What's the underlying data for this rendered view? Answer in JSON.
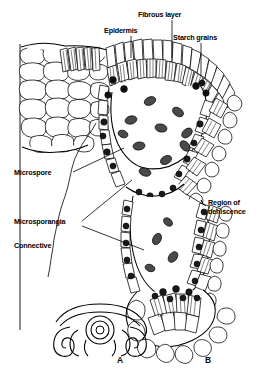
{
  "figure": {
    "background_color": "#ffffff",
    "ink_color": "#000000",
    "style": "black-and-white line drawing"
  },
  "labels": [
    {
      "id": "fibrous-layer",
      "text": "Fibrous layer",
      "x": 138,
      "y": 17,
      "anchor": "start"
    },
    {
      "id": "epidermis",
      "text": "Epidermis",
      "x": 104,
      "y": 33,
      "anchor": "start"
    },
    {
      "id": "starch-grains",
      "text": "Starch grains",
      "x": 173,
      "y": 40,
      "anchor": "start"
    },
    {
      "id": "microspore",
      "text": "Microspore",
      "x": 14,
      "y": 175,
      "anchor": "start"
    },
    {
      "id": "microsporangia",
      "text": "Microsporangia",
      "x": 14,
      "y": 224,
      "anchor": "start"
    },
    {
      "id": "connective",
      "text": "Connective",
      "x": 14,
      "y": 248,
      "anchor": "start"
    },
    {
      "id": "region-of-dehiscence-line1",
      "text": "Region of",
      "x": 208,
      "y": 205,
      "anchor": "start"
    },
    {
      "id": "region-of-dehiscence-line2",
      "text": "dehiscence",
      "x": 208,
      "y": 214,
      "anchor": "start"
    }
  ],
  "panels": [
    {
      "id": "panel-a",
      "text": "A",
      "x": 120,
      "y": 363
    },
    {
      "id": "panel-b",
      "text": "B",
      "x": 208,
      "y": 363
    }
  ],
  "structures": [
    "epidermis",
    "fibrous layer",
    "starch grains",
    "microspore",
    "microsporangia",
    "connective",
    "region of dehiscence"
  ]
}
